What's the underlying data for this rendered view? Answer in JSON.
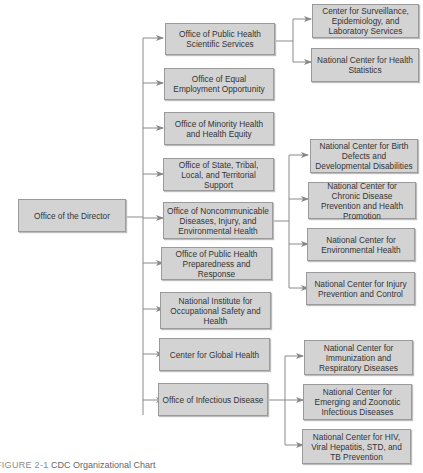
{
  "root": {
    "label": "Office of the Director"
  },
  "level1": [
    {
      "label": "Office of Public Health Scientific Services"
    },
    {
      "label": "Office of Equal Employment Opportunity"
    },
    {
      "label": "Office of Minority Health and Health Equity"
    },
    {
      "label": "Office of State, Tribal, Local, and Territorial Support"
    },
    {
      "label": "Office of Noncommunicable Diseases, Injury, and Environmental Health"
    },
    {
      "label": "Office of Public Health Preparedness and Response"
    },
    {
      "label": "National Institute for Occupational Safety and Health"
    },
    {
      "label": "Center for Global Health"
    },
    {
      "label": "Office of Infectious Disease"
    }
  ],
  "level2": {
    "scientific_services": [
      {
        "label": "Center for Surveillance, Epidemiology, and Laboratory Services"
      },
      {
        "label": "National Center for Health Statistics"
      }
    ],
    "noncommunicable": [
      {
        "label": "National Center for Birth Defects and Developmental Disabilities"
      },
      {
        "label": "National Center for Chronic Disease Prevention and Health Promotion"
      },
      {
        "label": "National Center for Environmental Health"
      },
      {
        "label": "National Center for Injury Prevention and Control"
      }
    ],
    "infectious": [
      {
        "label": "National Center for Immunization and Respiratory Diseases"
      },
      {
        "label": "National Center for Emerging and Zoonotic Infectious Diseases"
      },
      {
        "label": "National Center for HIV, Viral Hepatitis, STD, and TB Prevention"
      }
    ]
  },
  "caption": {
    "label": "FIGURE 2-1",
    "text": "CDC Organizational Chart"
  }
}
